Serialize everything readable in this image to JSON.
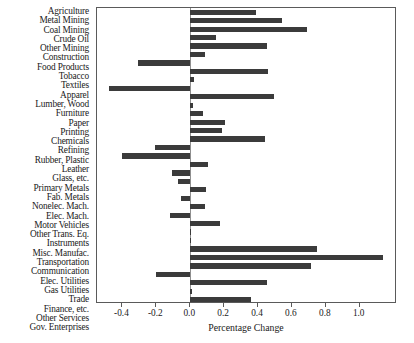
{
  "chart_data": {
    "type": "bar",
    "orientation": "horizontal",
    "title": "",
    "xlabel": "Percentage Change",
    "ylabel": "",
    "xlim": [
      -0.55,
      1.22
    ],
    "xticks": [
      -0.4,
      -0.2,
      0.0,
      0.2,
      0.4,
      0.6,
      0.8,
      1.0
    ],
    "xtick_labels": [
      "-0.4",
      "-0.2",
      "0.0",
      "0.2",
      "0.4",
      "0.6",
      "0.8",
      "1.0"
    ],
    "grid": false,
    "legend": null,
    "bar_color": "#3b3b3b",
    "frame_color": "#5a5a5a",
    "categories": [
      "Agriculture",
      "Metal Mining",
      "Coal Mining",
      "Crude Oil",
      "Other Mining",
      "Construction",
      "Food Products",
      "Tobacco",
      "Textiles",
      "Apparel",
      "Lumber, Wood",
      "Furniture",
      "Paper",
      "Printing",
      "Chemicals",
      "Refining",
      "Rubber, Plastic",
      "Leather",
      "Glass, etc.",
      "Primary Metals",
      "Fab. Metals",
      "Nonelec. Mach.",
      "Elec. Mach.",
      "Motor Vehicles",
      "Other Trans. Eq.",
      "Instruments",
      "Misc. Manufac.",
      "Transportation",
      "Communication",
      "Elec. Utilities",
      "Gas Utilities",
      "Trade",
      "Finance, etc.",
      "Other Services",
      "Gov. Enterprises"
    ],
    "values": [
      0.39,
      0.54,
      0.69,
      0.15,
      0.455,
      0.085,
      -0.31,
      0.46,
      0.02,
      -0.48,
      0.495,
      0.015,
      0.075,
      0.205,
      0.19,
      0.44,
      -0.21,
      -0.4,
      0.105,
      -0.11,
      -0.07,
      0.095,
      -0.055,
      0.085,
      -0.12,
      0.175,
      0.005,
      0.005,
      0.75,
      1.14,
      0.715,
      -0.2,
      0.455,
      0.01,
      0.36
    ]
  }
}
